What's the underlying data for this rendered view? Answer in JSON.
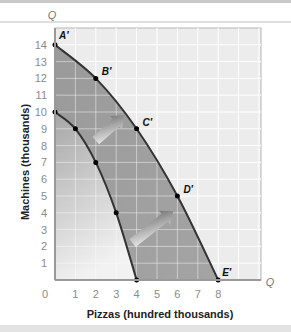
{
  "chart_data": {
    "type": "line",
    "title": "",
    "xlabel": "Pizzas (hundred thousands)",
    "ylabel": "Machines (thousands)",
    "x_axis_end_label": "Q",
    "y_axis_end_label": "Q",
    "xlim": [
      0,
      10.2
    ],
    "ylim": [
      0,
      14.9
    ],
    "x_ticks": [
      "0",
      "1",
      "2",
      "3",
      "4",
      "5",
      "6",
      "7",
      "8"
    ],
    "y_ticks": [
      "1",
      "2",
      "3",
      "4",
      "5",
      "6",
      "7",
      "8",
      "9",
      "10",
      "11",
      "12",
      "13",
      "14"
    ],
    "grid": true,
    "legend": null,
    "series": [
      {
        "name": "Original PPF",
        "points": [
          {
            "x": 0,
            "y": 10,
            "label": ""
          },
          {
            "x": 1,
            "y": 9,
            "label": ""
          },
          {
            "x": 2,
            "y": 7,
            "label": ""
          },
          {
            "x": 3,
            "y": 4,
            "label": ""
          },
          {
            "x": 4,
            "y": 0,
            "label": ""
          }
        ]
      },
      {
        "name": "Expanded PPF",
        "points": [
          {
            "x": 0,
            "y": 14,
            "label": "A′"
          },
          {
            "x": 2,
            "y": 12,
            "label": "B′"
          },
          {
            "x": 4,
            "y": 9,
            "label": "C′"
          },
          {
            "x": 6,
            "y": 5,
            "label": "D′"
          },
          {
            "x": 8,
            "y": 0,
            "label": "E′"
          }
        ]
      }
    ],
    "annotations": [
      {
        "type": "arrow",
        "description": "shift outward arrow",
        "from": {
          "x": 2,
          "y": 8.3
        },
        "to": {
          "x": 3.4,
          "y": 9.8
        }
      },
      {
        "type": "arrow",
        "description": "shift outward arrow",
        "from": {
          "x": 3.8,
          "y": 2.2
        },
        "to": {
          "x": 5.8,
          "y": 4.1
        }
      }
    ],
    "colors": {
      "curve": "#333333",
      "outside_fill": "#ececec",
      "band_fill": "#9c9c9c",
      "inner_fill_top": "#a6a6a6",
      "inner_fill_bottom": "#f2f2f2",
      "grid": "#ffffff"
    }
  }
}
